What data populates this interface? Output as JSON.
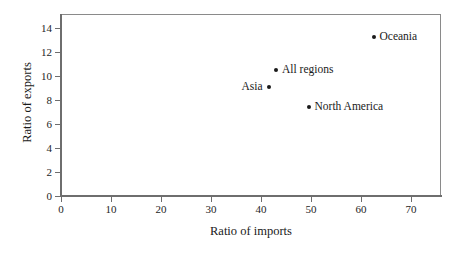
{
  "chart_data": {
    "type": "scatter",
    "title": "",
    "xlabel": "Ratio of imports",
    "ylabel": "Ratio of exports",
    "xlim": [
      0,
      76
    ],
    "ylim": [
      0,
      15.2
    ],
    "xticks": [
      0,
      10,
      20,
      30,
      40,
      50,
      60,
      70
    ],
    "xtick_labels": [
      "0",
      "10",
      "20",
      "30",
      "40",
      "50",
      "60",
      "70"
    ],
    "yticks": [
      0,
      2,
      4,
      6,
      8,
      10,
      12,
      14
    ],
    "ytick_labels": [
      "0",
      "2",
      "4",
      "6",
      "8",
      "10",
      "12",
      "14"
    ],
    "grid": false,
    "legend": "none",
    "marker_color": "#1a1a1a",
    "frame_color": "#8a8a8a",
    "background": "#ffffff",
    "points": [
      {
        "label": "Oceania",
        "x": 62.5,
        "y": 13.3,
        "label_side": "right"
      },
      {
        "label": "All regions",
        "x": 43.0,
        "y": 10.5,
        "label_side": "right"
      },
      {
        "label": "Asia",
        "x": 41.5,
        "y": 9.1,
        "label_side": "left"
      },
      {
        "label": "North America",
        "x": 49.5,
        "y": 7.4,
        "label_side": "right"
      }
    ]
  }
}
